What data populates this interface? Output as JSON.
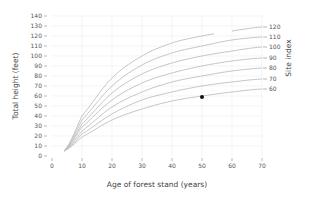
{
  "chart_data": {
    "type": "line",
    "title": "",
    "xlabel": "Age of forest stand (years)",
    "ylabel": "Total height (feet)",
    "y2label": "Site index",
    "xlim": [
      0,
      70
    ],
    "ylim": [
      0,
      140
    ],
    "xticks": [
      0,
      10,
      20,
      30,
      40,
      50,
      60,
      70
    ],
    "yticks": [
      0,
      10,
      20,
      30,
      40,
      50,
      60,
      70,
      80,
      90,
      100,
      110,
      120,
      130,
      140
    ],
    "grid": true,
    "x": [
      4,
      10,
      20,
      30,
      40,
      50,
      60,
      70
    ],
    "series": [
      {
        "name": "120",
        "values": [
          5,
          40,
          78,
          100,
          113,
          120,
          125,
          129
        ],
        "gap": [
          54,
          60
        ]
      },
      {
        "name": "110",
        "values": [
          5,
          36,
          70,
          91,
          103,
          110,
          116,
          119
        ]
      },
      {
        "name": "100",
        "values": [
          5,
          32,
          63,
          82,
          93,
          100,
          105,
          109
        ]
      },
      {
        "name": "90",
        "values": [
          5,
          29,
          56,
          73,
          83,
          90,
          95,
          98
        ]
      },
      {
        "name": "80",
        "values": [
          5,
          25,
          49,
          64,
          74,
          80,
          85,
          88
        ]
      },
      {
        "name": "70",
        "values": [
          5,
          22,
          42,
          56,
          64,
          70,
          74,
          77
        ]
      },
      {
        "name": "60",
        "values": [
          5,
          19,
          36,
          47,
          55,
          60,
          64,
          67
        ]
      }
    ],
    "highlight_point": {
      "x": 50,
      "y": 59,
      "series": "60"
    },
    "colors": {
      "curve": "#bdbdbd",
      "grid": "#ececec",
      "point": "#111111",
      "text": "#555555"
    }
  }
}
